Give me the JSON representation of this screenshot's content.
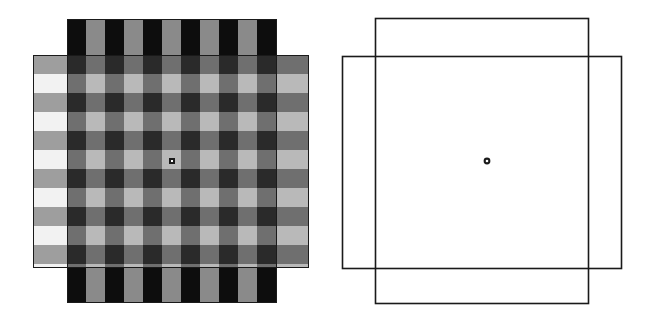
{
  "figure": {
    "title": "",
    "background_color": "#ffffff",
    "width": 654,
    "height": 320,
    "panel_count": 2
  },
  "palette": {
    "white": "#ffffff",
    "stripe_dark": "#0d0d0d",
    "stripe_mid": "#8a8a8a",
    "overlay_on_dark": "#6f6f6f",
    "overlay_on_mid": "#b9b9b9",
    "plaid_dark_cross": "#2a2a2a",
    "plaid_light_band": "#f2f2f2",
    "plaid_mid_band": "#9e9e9e",
    "outline_stroke": "#1a1a1a",
    "fixation_ring": "#1a1a1a",
    "fixation_center": "#ffffff"
  },
  "left_panel": {
    "name": "transparency-stimulus-rendered",
    "origin_x": 0,
    "origin_y": 0,
    "width": 330,
    "height": 320,
    "background_square": {
      "label": "striped-square",
      "x": 67,
      "y": 19,
      "width": 210,
      "height": 284,
      "stripe_orientation": "vertical",
      "stripe_period": 38,
      "stripe_bar_width": 19,
      "stripe_count": 11,
      "stripe_colors": [
        "#0d0d0d",
        "#8a8a8a"
      ],
      "border_color": "#1a1a1a",
      "border_width": 1
    },
    "overlay_square": {
      "label": "transparent-overlay-square",
      "x": 33,
      "y": 55,
      "width": 276,
      "height": 213,
      "horizontal_band_period": 38,
      "horizontal_band_count": 11,
      "band_colors": [
        "#f2f2f2",
        "#9e9e9e"
      ],
      "alpha_description": "light translucent layer producing plaid crossings",
      "border_color": "#1a1a1a",
      "border_width": 1
    },
    "fixation_point": {
      "label": "fixation-dot",
      "cx": 172,
      "cy": 161,
      "outer_radius": 3.4,
      "inner_radius": 1.3
    }
  },
  "right_panel": {
    "name": "geometry-outline-diagram",
    "origin_x": 330,
    "origin_y": 0,
    "width": 324,
    "height": 320,
    "squares": [
      {
        "label": "outline-square-background",
        "x": 375,
        "y": 18,
        "width": 213,
        "height": 285,
        "stroke": "#1a1a1a",
        "stroke_width": 1.6,
        "fill": "none"
      },
      {
        "label": "outline-square-overlay",
        "x": 342,
        "y": 56,
        "width": 279,
        "height": 212,
        "stroke": "#1a1a1a",
        "stroke_width": 1.6,
        "fill": "none"
      }
    ],
    "fixation_point": {
      "label": "fixation-dot",
      "cx": 487,
      "cy": 161,
      "outer_radius": 3.4,
      "inner_radius": 1.3
    }
  },
  "annotations": {
    "captions": [],
    "axis_labels": [],
    "legend": []
  },
  "chart_data": {
    "type": "diagram",
    "title": "",
    "panels": [
      {
        "name": "stimulus",
        "elements": [
          "striped-square",
          "transparent-overlay-square",
          "fixation-dot"
        ]
      },
      {
        "name": "outline",
        "elements": [
          "outline-square-background",
          "outline-square-overlay",
          "fixation-dot"
        ]
      }
    ]
  }
}
